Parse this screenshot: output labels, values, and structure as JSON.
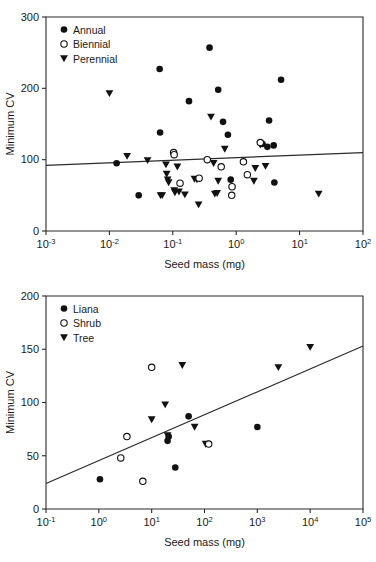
{
  "figure": {
    "panels": [
      "top",
      "bottom"
    ]
  },
  "chart_data": [
    {
      "panel": "top",
      "type": "scatter",
      "title": "",
      "xlabel": "Seed mass (mg)",
      "ylabel": "Minimum CV",
      "xscale": "log",
      "yscale": "linear",
      "xlim": [
        0.001,
        100
      ],
      "ylim": [
        0,
        300
      ],
      "xticks": [
        {
          "value": 0.001,
          "base": "10",
          "exp": "-3"
        },
        {
          "value": 0.01,
          "base": "10",
          "exp": "-2"
        },
        {
          "value": 0.1,
          "base": "10",
          "exp": "-1"
        },
        {
          "value": 1,
          "base": "10",
          "exp": "0"
        },
        {
          "value": 10,
          "base": "10",
          "exp": "1"
        },
        {
          "value": 100,
          "base": "10",
          "exp": "2"
        }
      ],
      "yticks": [
        0,
        100,
        200,
        300
      ],
      "grid": false,
      "legend_position": "top-left",
      "legend": [
        {
          "name": "Annual",
          "marker": "filled-circle"
        },
        {
          "name": "Biennial",
          "marker": "open-circle"
        },
        {
          "name": "Perennial",
          "marker": "filled-triangle-down"
        }
      ],
      "fit_line": {
        "x0": 0.001,
        "y0": 92,
        "x1": 100,
        "y1": 110
      },
      "series": [
        {
          "name": "Annual",
          "marker": "filled-circle",
          "points": [
            [
              0.013,
              95
            ],
            [
              0.029,
              50
            ],
            [
              0.062,
              227
            ],
            [
              0.063,
              138
            ],
            [
              0.18,
              182
            ],
            [
              0.38,
              257
            ],
            [
              0.52,
              198
            ],
            [
              0.62,
              153
            ],
            [
              0.74,
              135
            ],
            [
              0.82,
              72
            ],
            [
              0.86,
              62
            ],
            [
              2.6,
              122
            ],
            [
              3.1,
              118
            ],
            [
              3.3,
              155
            ],
            [
              3.9,
              120
            ],
            [
              4.0,
              68
            ],
            [
              5.1,
              212
            ]
          ]
        },
        {
          "name": "Biennial",
          "marker": "open-circle",
          "points": [
            [
              0.103,
              110
            ],
            [
              0.105,
              107
            ],
            [
              0.13,
              67
            ],
            [
              0.26,
              74
            ],
            [
              0.35,
              100
            ],
            [
              0.58,
              90
            ],
            [
              0.85,
              50
            ],
            [
              0.86,
              62
            ],
            [
              1.3,
              97
            ],
            [
              1.5,
              79
            ],
            [
              2.4,
              124
            ]
          ]
        },
        {
          "name": "Perennial",
          "marker": "filled-triangle-down",
          "points": [
            [
              0.01,
              193
            ],
            [
              0.019,
              105
            ],
            [
              0.04,
              99
            ],
            [
              0.064,
              50
            ],
            [
              0.068,
              50
            ],
            [
              0.078,
              93
            ],
            [
              0.08,
              80
            ],
            [
              0.083,
              72
            ],
            [
              0.086,
              68
            ],
            [
              0.105,
              57
            ],
            [
              0.108,
              54
            ],
            [
              0.118,
              90
            ],
            [
              0.125,
              55
            ],
            [
              0.155,
              51
            ],
            [
              0.22,
              73
            ],
            [
              0.24,
              72
            ],
            [
              0.255,
              37
            ],
            [
              0.4,
              160
            ],
            [
              0.44,
              95
            ],
            [
              0.46,
              52
            ],
            [
              0.5,
              53
            ],
            [
              0.52,
              70
            ],
            [
              0.66,
              115
            ],
            [
              1.9,
              70
            ],
            [
              2.0,
              88
            ],
            [
              2.4,
              121
            ],
            [
              2.9,
              91
            ],
            [
              20.0,
              52
            ]
          ]
        }
      ]
    },
    {
      "panel": "bottom",
      "type": "scatter",
      "title": "",
      "xlabel": "Seed mass (mg)",
      "ylabel": "Minimum CV",
      "xscale": "log",
      "yscale": "linear",
      "xlim": [
        0.1,
        100000
      ],
      "ylim": [
        0,
        200
      ],
      "xticks": [
        {
          "value": 0.1,
          "base": "10",
          "exp": "-1"
        },
        {
          "value": 1,
          "base": "10",
          "exp": "0"
        },
        {
          "value": 10,
          "base": "10",
          "exp": "1"
        },
        {
          "value": 100,
          "base": "10",
          "exp": "2"
        },
        {
          "value": 1000,
          "base": "10",
          "exp": "3"
        },
        {
          "value": 10000,
          "base": "10",
          "exp": "4"
        },
        {
          "value": 100000,
          "base": "10",
          "exp": "5"
        }
      ],
      "yticks": [
        0,
        50,
        100,
        150,
        200
      ],
      "grid": false,
      "legend_position": "top-left",
      "legend": [
        {
          "name": "Liana",
          "marker": "filled-circle"
        },
        {
          "name": "Shrub",
          "marker": "open-circle"
        },
        {
          "name": "Tree",
          "marker": "filled-triangle-down"
        }
      ],
      "fit_line": {
        "x0": 0.1,
        "y0": 24,
        "x1": 100000,
        "y1": 153
      },
      "series": [
        {
          "name": "Liana",
          "marker": "filled-circle",
          "points": [
            [
              1.05,
              28
            ],
            [
              20,
              64
            ],
            [
              21,
              68
            ],
            [
              28,
              39
            ],
            [
              50,
              87
            ],
            [
              1000,
              77
            ]
          ]
        },
        {
          "name": "Shrub",
          "marker": "open-circle",
          "points": [
            [
              2.6,
              48
            ],
            [
              3.4,
              68
            ],
            [
              6.8,
              26
            ],
            [
              10,
              133
            ],
            [
              120,
              61
            ]
          ]
        },
        {
          "name": "Tree",
          "marker": "filled-triangle-down",
          "points": [
            [
              10,
              84
            ],
            [
              18,
              98
            ],
            [
              20,
              69
            ],
            [
              38,
              135
            ],
            [
              65,
              77
            ],
            [
              105,
              61
            ],
            [
              2500,
              133
            ],
            [
              10000,
              152
            ]
          ]
        }
      ]
    }
  ]
}
